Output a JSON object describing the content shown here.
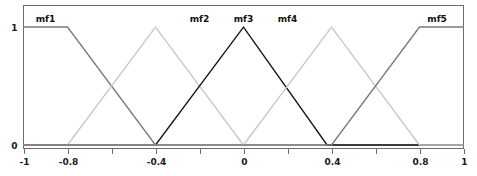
{
  "chart_data": {
    "type": "line",
    "title": "",
    "xlabel": "",
    "ylabel": "",
    "xlim": [
      -1,
      1
    ],
    "ylim": [
      0,
      1
    ],
    "grid": false,
    "legend_position": "inline-above-peaks",
    "xticks": [
      -1,
      -0.8,
      -0.6,
      -0.4,
      -0.2,
      0,
      0.2,
      0.4,
      0.6,
      0.8,
      1
    ],
    "xtick_labels": [
      "-1",
      "-0.8",
      "",
      "-0.4",
      "",
      "0",
      "",
      "0.4",
      "",
      "0.8",
      "1"
    ],
    "yticks": [
      0,
      1
    ],
    "ytick_labels": [
      "0",
      "1"
    ],
    "series": [
      {
        "name": "mf1",
        "label": "mf1",
        "shape": "trapezoid",
        "color": "#7a7a7a",
        "label_x": -0.9,
        "points": [
          [
            -1,
            1
          ],
          [
            -0.8,
            1
          ],
          [
            -0.4,
            0
          ],
          [
            1,
            0
          ]
        ]
      },
      {
        "name": "mf2",
        "label": "mf2",
        "shape": "triangle",
        "color": "#c8c8c8",
        "label_x": -0.2,
        "points": [
          [
            -1,
            0
          ],
          [
            -0.8,
            0
          ],
          [
            -0.4,
            1
          ],
          [
            0,
            0
          ],
          [
            1,
            0
          ]
        ]
      },
      {
        "name": "mf3",
        "label": "mf3",
        "shape": "triangle",
        "color": "#141414",
        "label_x": 0.0,
        "points": [
          [
            -1,
            0
          ],
          [
            -0.4,
            0
          ],
          [
            0,
            1
          ],
          [
            0.38,
            0
          ],
          [
            1,
            0
          ]
        ]
      },
      {
        "name": "mf4",
        "label": "mf4",
        "shape": "triangle",
        "color": "#c8c8c8",
        "label_x": 0.2,
        "points": [
          [
            -1,
            0
          ],
          [
            0,
            0
          ],
          [
            0.4,
            1
          ],
          [
            0.8,
            0
          ],
          [
            1,
            0
          ]
        ]
      },
      {
        "name": "mf5",
        "label": "mf5",
        "shape": "trapezoid",
        "color": "#7a7a7a",
        "label_x": 0.88,
        "points": [
          [
            -1,
            0
          ],
          [
            0.4,
            0
          ],
          [
            0.8,
            1
          ],
          [
            1,
            1
          ]
        ]
      }
    ]
  },
  "plot": {
    "frame_color": "#6e6e6e",
    "background": "#ffffff"
  }
}
